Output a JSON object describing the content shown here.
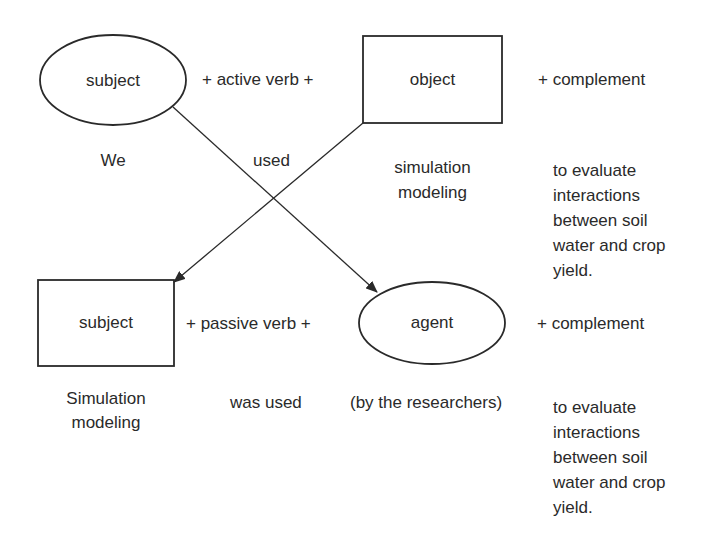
{
  "active": {
    "shape_left": {
      "label": "subject",
      "shape": "ellipse"
    },
    "verb_connector": "+  active verb  +",
    "shape_right": {
      "label": "object",
      "shape": "rectangle"
    },
    "complement_connector": "+ complement",
    "example": {
      "subject": "We",
      "verb": "used",
      "object_line1": "simulation",
      "object_line2": "modeling",
      "complement_lines": [
        "to evaluate",
        "interactions",
        "between soil",
        "water and crop",
        "yield."
      ]
    }
  },
  "passive": {
    "shape_left": {
      "label": "subject",
      "shape": "rectangle"
    },
    "verb_connector": "+  passive verb  +",
    "shape_right": {
      "label": "agent",
      "shape": "ellipse"
    },
    "complement_connector": "+ complement",
    "example": {
      "subject_line1": "Simulation",
      "subject_line2": "modeling",
      "verb": "was used",
      "agent": "(by the researchers)",
      "complement_lines": [
        "to evaluate",
        "interactions",
        "between soil",
        "water and crop",
        "yield."
      ]
    }
  },
  "arrows": [
    {
      "from": "active subject (ellipse)",
      "to": "passive agent (ellipse)"
    },
    {
      "from": "active object (rectangle)",
      "to": "passive subject (rectangle)"
    }
  ],
  "colors": {
    "stroke": "#2a2a2a",
    "background": "#ffffff"
  }
}
